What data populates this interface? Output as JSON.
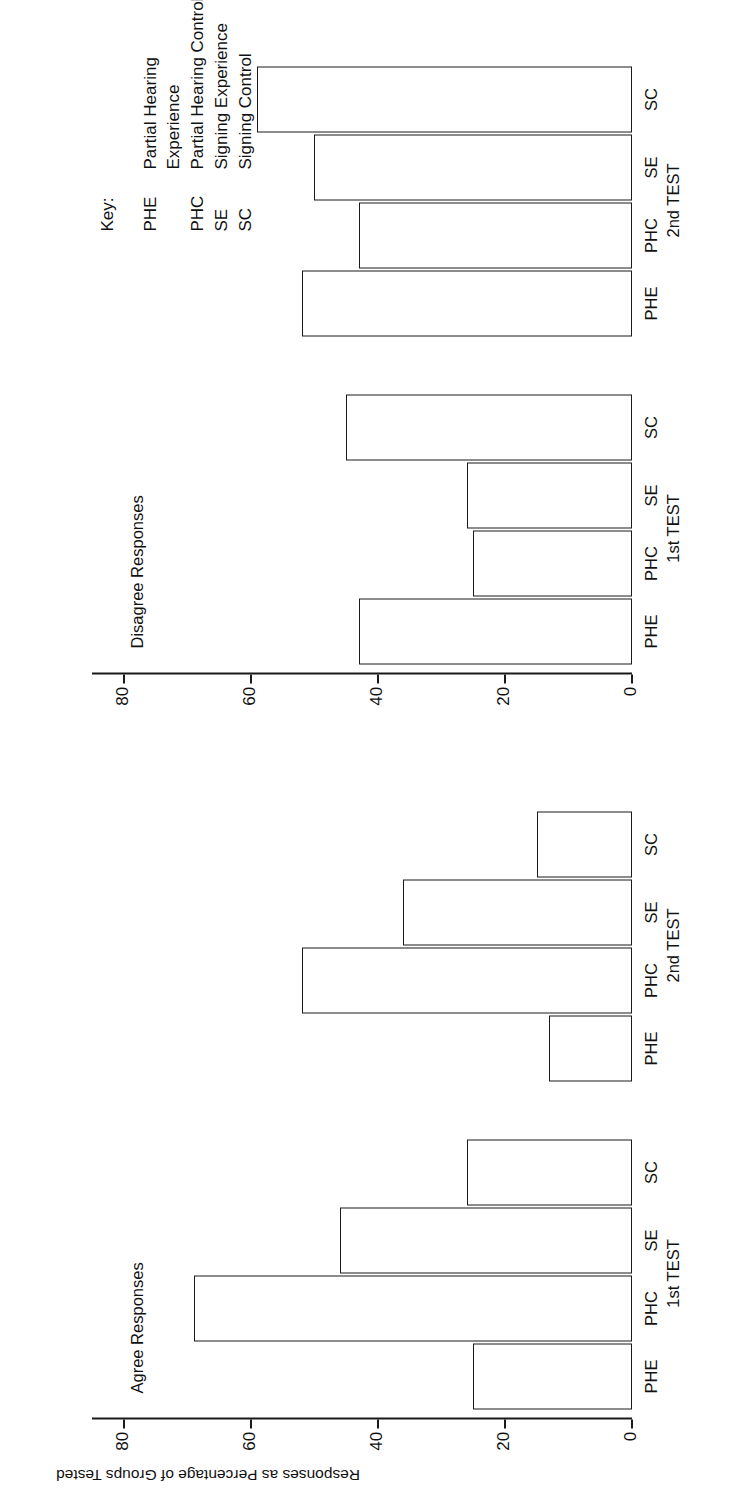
{
  "figure": {
    "y_axis_title": "Responses as Percentage of Groups Tested",
    "key_heading": "Key:"
  },
  "key": {
    "entries": [
      {
        "abbr": "PHE",
        "label": "Partial Hearing\nExperience",
        "line1": "Partial Hearing",
        "line2": "Experience"
      },
      {
        "abbr": "PHC",
        "label": "Partial Hearing Control",
        "line1": "Partial Hearing Control",
        "line2": ""
      },
      {
        "abbr": "SE",
        "label": "Signing Experience",
        "line1": "Signing Experience",
        "line2": ""
      },
      {
        "abbr": "SC",
        "label": "Signing Control",
        "line1": "Signing Control",
        "line2": ""
      }
    ]
  },
  "chart_data": [
    {
      "type": "bar",
      "title": "Agree Responses",
      "orientation": "vertical",
      "xlabel": "",
      "ylabel": "Responses as Percentage of Groups Tested",
      "ylim": [
        0,
        85
      ],
      "yticks": [
        0,
        20,
        40,
        60,
        80
      ],
      "ytick_labels": [
        "0",
        "20",
        "40",
        "60",
        "80"
      ],
      "grid": false,
      "legend": "none",
      "group_labels": [
        "1st TEST",
        "2nd TEST"
      ],
      "categories": [
        "PHE",
        "PHC",
        "SE",
        "SC",
        "PHE",
        "PHC",
        "SE",
        "SC"
      ],
      "values": [
        25,
        69,
        46,
        26,
        13,
        52,
        36,
        15
      ]
    },
    {
      "type": "bar",
      "title": "Disagree Responses",
      "orientation": "vertical",
      "xlabel": "",
      "ylabel": "",
      "ylim": [
        0,
        85
      ],
      "yticks": [
        0,
        20,
        40,
        60,
        80
      ],
      "ytick_labels": [
        "0",
        "20",
        "40",
        "60",
        "80"
      ],
      "grid": false,
      "legend": "none",
      "group_labels": [
        "1st TEST",
        "2nd TEST"
      ],
      "categories": [
        "PHE",
        "PHC",
        "SE",
        "SC",
        "PHE",
        "PHC",
        "SE",
        "SC"
      ],
      "values": [
        43,
        25,
        26,
        45,
        52,
        43,
        50,
        59
      ]
    }
  ]
}
